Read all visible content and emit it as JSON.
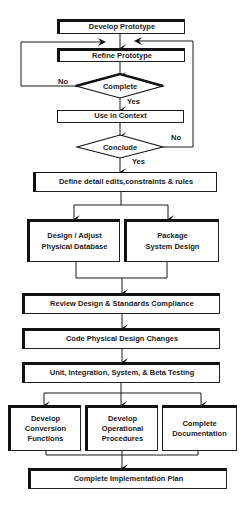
{
  "diagram": {
    "type": "flowchart",
    "nodes": {
      "develop_prototype": "Develop Prototype",
      "refine_prototype": "Refine Prototype",
      "complete_decision": "Complete",
      "use_in_context": "Use in Context",
      "conclude_decision": "Conclude",
      "define_detail": "Define detail edits,constraints & rules",
      "design_adjust_db": "Design / Adjust\nPhysical Database",
      "package_system": "Package\nSystem Design",
      "review_design": "Review Design & Standards Compliance",
      "code_changes": "Code Physical Design Changes",
      "testing": "Unit, Integration, System, & Beta Testing",
      "develop_conversion": "Develop\nConversion\nFunctions",
      "develop_operational": "Develop\nOperational\nProcedures",
      "complete_documentation": "Complete\nDocumentation",
      "complete_plan": "Complete Implementation Plan"
    },
    "edge_labels": {
      "complete_no": "No",
      "complete_yes": "Yes",
      "conclude_no": "No",
      "conclude_yes": "Yes"
    },
    "colors": {
      "line": "#1a1a1a",
      "background": "#ffffff"
    }
  }
}
